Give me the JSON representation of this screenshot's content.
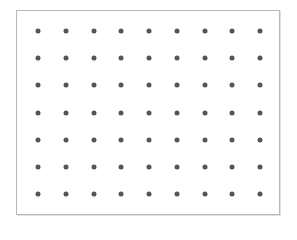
{
  "diagram": {
    "type": "dot-grid",
    "rows": 7,
    "columns": 9,
    "dot_color": "#555555",
    "frame_color": "#b8b8b8",
    "background": "#ffffff",
    "origin": [
      38,
      31
    ],
    "spacing": [
      27.75,
      27.2
    ]
  }
}
